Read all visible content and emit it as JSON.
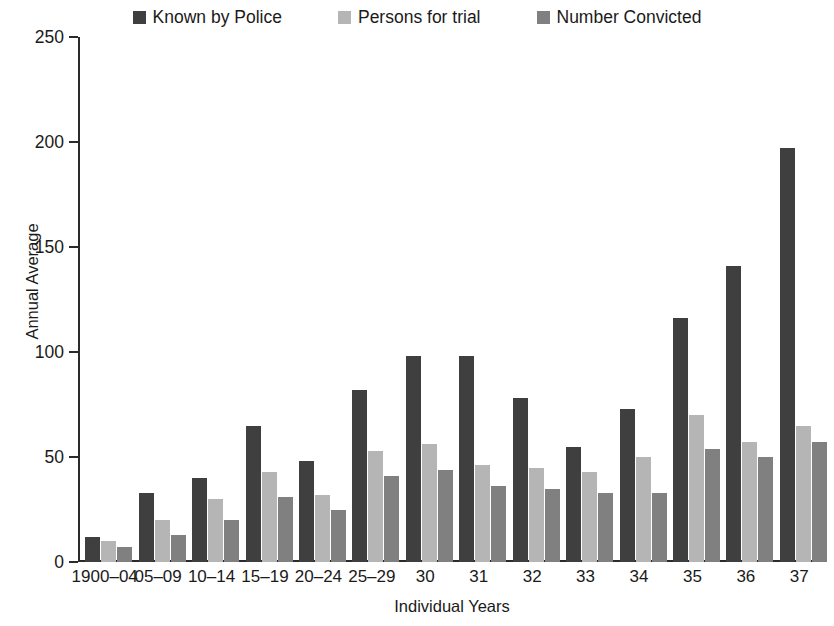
{
  "chart_data": {
    "type": "bar",
    "title": "",
    "xlabel": "Individual Years",
    "ylabel": "Annual Average",
    "ylim": [
      0,
      250
    ],
    "yticks": [
      0,
      50,
      100,
      150,
      200,
      250
    ],
    "grid": false,
    "legend_position": "top-center",
    "categories": [
      "1900–04",
      "05–09",
      "10–14",
      "15–19",
      "20–24",
      "25–29",
      "30",
      "31",
      "32",
      "33",
      "34",
      "35",
      "36",
      "37"
    ],
    "series": [
      {
        "name": "Known by Police",
        "color": "#3f3f3f",
        "values": [
          12,
          33,
          40,
          65,
          48,
          82,
          98,
          98,
          78,
          55,
          73,
          116,
          141,
          197
        ]
      },
      {
        "name": "Persons for trial",
        "color": "#b5b5b5",
        "values": [
          10,
          20,
          30,
          43,
          32,
          53,
          56,
          46,
          45,
          43,
          50,
          70,
          57,
          65
        ]
      },
      {
        "name": "Number Convicted",
        "color": "#808080",
        "values": [
          7,
          13,
          20,
          31,
          25,
          41,
          44,
          36,
          35,
          33,
          33,
          54,
          50,
          57
        ]
      }
    ]
  },
  "legend": {
    "items": [
      {
        "label": "Known by Police",
        "color": "#3f3f3f"
      },
      {
        "label": "Persons for trial",
        "color": "#b5b5b5"
      },
      {
        "label": "Number Convicted",
        "color": "#808080"
      }
    ]
  },
  "axes": {
    "y_title": "Annual Average",
    "x_title": "Individual Years",
    "y_tick_labels": [
      "250",
      "200",
      "150",
      "100",
      "50",
      "0"
    ],
    "x_tick_labels": [
      "1900–04",
      "05–09",
      "10–14",
      "15–19",
      "20–24",
      "25–29",
      "30",
      "31",
      "32",
      "33",
      "34",
      "35",
      "36",
      "37"
    ]
  }
}
